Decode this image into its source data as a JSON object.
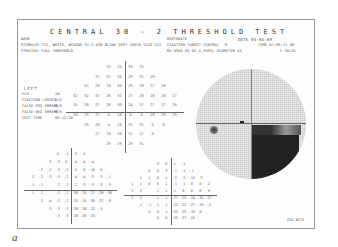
{
  "header": {
    "title": "CENTRAL 30 - 2 THRESHOLD TEST",
    "name_label": "NAME",
    "stimulus": "STIMULUS III, WHITE, BCKGND 31.5 ASB  BLIND SPOT CHECK SIZE III",
    "strategy": "STRATEGY FULL THRESHOLD",
    "birthdate_label": "BIRTHDATE",
    "fixation_target": "FIXATION TARGET CENTRAL",
    "fixation_extra": "R",
    "rx_line": "RX USED  DS  DC  X  PUPIL DIAMETER  VA",
    "date": "DATE 04-03-09",
    "time": "TIME 07:09:11 AM",
    "va_value": "V 20/25"
  },
  "reliability": {
    "eye": "LEFT",
    "items": [
      {
        "label": "FIX",
        "value": "IN"
      },
      {
        "label": "FIXATION LOSSES",
        "value": "0/0"
      },
      {
        "label": "FALSE POS ERRORS",
        "value": "0/0"
      },
      {
        "label": "FALSE NEG ERRORS",
        "value": "0/0"
      },
      {
        "label": "TEST TIME",
        "value": "00:12:20"
      }
    ]
  },
  "threshold_grid": [
    [
      "",
      "",
      "",
      "25",
      "25",
      "33",
      "25",
      "",
      "",
      ""
    ],
    [
      "",
      "",
      "27",
      "31",
      "32",
      "29",
      "31",
      "29",
      "",
      ""
    ],
    [
      "",
      "31",
      "29",
      "28",
      "30",
      "29",
      "28",
      "27",
      "28",
      ""
    ],
    [
      "32",
      "32",
      "32",
      "26",
      "32",
      "27",
      "28",
      "28",
      "28",
      "27"
    ],
    [
      "31",
      "30",
      "27",
      "28",
      "30",
      "24",
      "27",
      "27",
      "27",
      "29"
    ],
    [
      "30",
      "29",
      "27",
      "0",
      "26",
      "6",
      "0",
      "28",
      "29",
      "29"
    ],
    [
      "",
      "29",
      "28",
      "4",
      "26",
      "31",
      "31",
      "0",
      "0",
      ""
    ],
    [
      "",
      "",
      "27",
      "28",
      "28",
      "31",
      "27",
      "0",
      "",
      ""
    ],
    [
      "",
      "",
      "",
      "29",
      "29",
      "29",
      "31",
      "",
      "",
      ""
    ]
  ],
  "total_deviation": [
    [
      "",
      "",
      "",
      "0",
      "-1",
      "-3",
      "-5",
      "",
      "",
      ""
    ],
    [
      "",
      "",
      "-3",
      "-3",
      "0",
      "-4",
      "-4",
      "-4",
      "",
      ""
    ],
    [
      "",
      "-2",
      "-2",
      "-3",
      "-2",
      "-5",
      "-8",
      "-16",
      "-6",
      ""
    ],
    [
      "-2",
      "-2",
      "-3",
      "-3",
      "-2",
      "-4",
      "-4",
      "-3",
      "-3",
      "-1"
    ],
    [
      "-1",
      "-1",
      "",
      "-2",
      "-2",
      "-2",
      "-3",
      "-3",
      "-3",
      "-3"
    ],
    [
      "-1",
      "-1",
      "",
      "-2",
      "-2",
      "-30",
      "-25",
      "-27",
      "-28",
      "-30"
    ],
    [
      "",
      "-2",
      "-4",
      "-2",
      "-2",
      "-25",
      "-25",
      "-30",
      "-22",
      "-8"
    ],
    [
      "",
      "",
      "-3",
      "-3",
      "-2",
      "-28",
      "-28",
      "-22",
      "-3",
      ""
    ],
    [
      "",
      "",
      "",
      "-3",
      "-3",
      "-28",
      "-30",
      "-25",
      "",
      ""
    ]
  ],
  "pattern_deviation": [
    [
      "",
      "",
      "",
      "3",
      "0",
      "1",
      "-1",
      "",
      "",
      ""
    ],
    [
      "",
      "",
      "0",
      "0",
      "3",
      "-1",
      "-1",
      "-1",
      "",
      ""
    ],
    [
      "",
      "1",
      "1",
      "0",
      "1",
      "-2",
      "-5",
      "-12",
      "-3",
      ""
    ],
    [
      "1",
      "1",
      "0",
      "0",
      "1",
      "-1",
      "-1",
      "0",
      "0",
      "2"
    ],
    [
      "2",
      "2",
      "",
      "1",
      "1",
      "1",
      "0",
      "0",
      "0",
      "0"
    ],
    [
      "2",
      "2",
      "",
      "1",
      "1",
      "-27",
      "-22",
      "-24",
      "-25",
      "-27"
    ],
    [
      "",
      "1",
      "-1",
      "1",
      "1",
      "-22",
      "-22",
      "-27",
      "-19",
      "-5"
    ],
    [
      "",
      "",
      "0",
      "0",
      "1",
      "-25",
      "-25",
      "-19",
      "0",
      ""
    ],
    [
      "",
      "",
      "",
      "0",
      "0",
      "-25",
      "-27",
      "-22",
      "",
      ""
    ]
  ],
  "footer": {
    "signature": "GSA  WITE"
  },
  "caption": "a"
}
